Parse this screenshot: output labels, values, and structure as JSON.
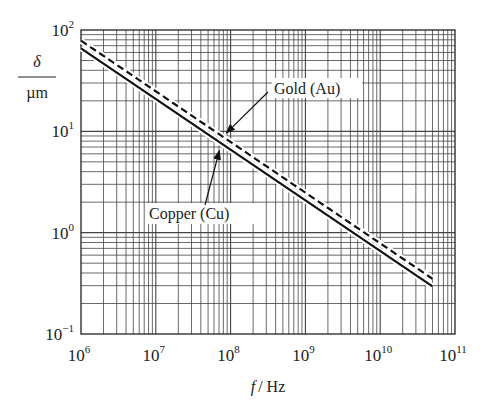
{
  "chart_data": {
    "type": "line",
    "title": "",
    "xlabel": "f / Hz",
    "xlabel_italic": "f",
    "xlabel_unit": "/ Hz",
    "ylabel_num": "δ",
    "ylabel_den": "µm",
    "xscale": "log",
    "yscale": "log",
    "xlim": [
      1000000.0,
      100000000000.0
    ],
    "ylim": [
      0.1,
      100
    ],
    "grid": true,
    "x_ticks": [
      {
        "base": "10",
        "exp": "6",
        "value": 1000000.0
      },
      {
        "base": "10",
        "exp": "7",
        "value": 10000000.0
      },
      {
        "base": "10",
        "exp": "8",
        "value": 100000000.0
      },
      {
        "base": "10",
        "exp": "9",
        "value": 1000000000.0
      },
      {
        "base": "10",
        "exp": "10",
        "value": 10000000000.0
      },
      {
        "base": "10",
        "exp": "11",
        "value": 100000000000.0
      }
    ],
    "y_ticks": [
      {
        "base": "10",
        "exp": "−1",
        "value": 0.1
      },
      {
        "base": "10",
        "exp": "0",
        "value": 1
      },
      {
        "base": "10",
        "exp": "1",
        "value": 10
      },
      {
        "base": "10",
        "exp": "2",
        "value": 100
      }
    ],
    "series": [
      {
        "name": "Gold (Au)",
        "style": "dashed",
        "x": [
          1000000.0,
          50000000000.0
        ],
        "y": [
          78.5,
          0.351
        ]
      },
      {
        "name": "Copper (Cu)",
        "style": "solid",
        "x": [
          1000000.0,
          50000000000.0
        ],
        "y": [
          66.0,
          0.295
        ]
      }
    ],
    "annotations": [
      {
        "text": "Gold (Au)",
        "points_to": "Gold (Au)",
        "at_x": 80000000.0
      },
      {
        "text": "Copper (Cu)",
        "points_to": "Copper (Cu)",
        "at_x": 80000000.0
      }
    ]
  }
}
